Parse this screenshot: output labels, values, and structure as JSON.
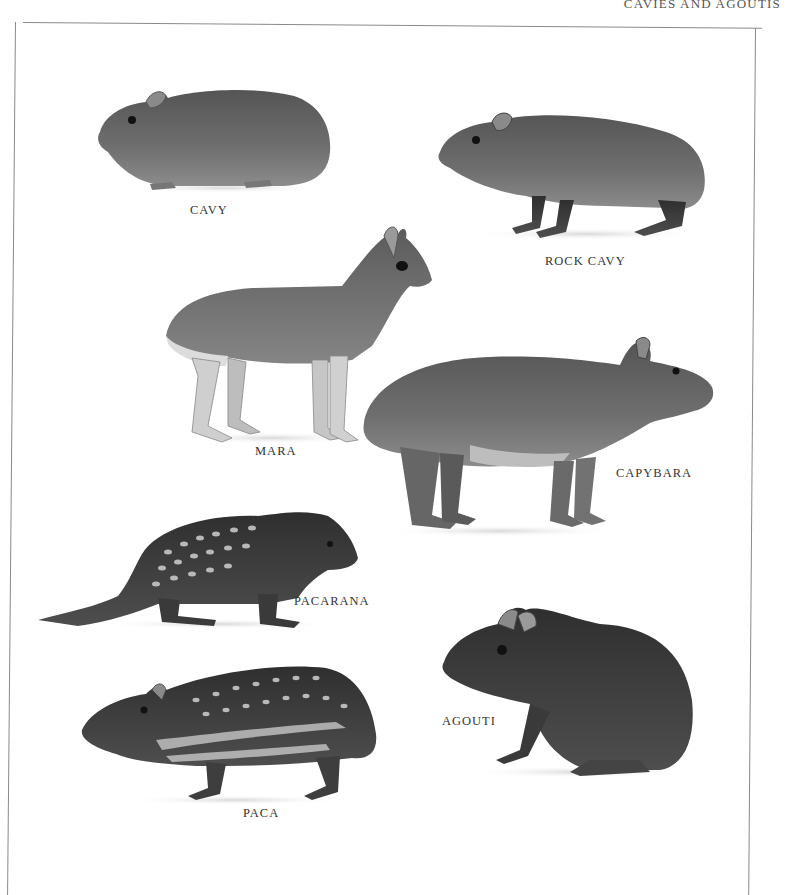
{
  "page": {
    "running_head": "CAVIES AND AGOUTIS"
  },
  "plate": {
    "animals": [
      {
        "id": "cavy",
        "label": "CAVY"
      },
      {
        "id": "rock-cavy",
        "label": "ROCK CAVY"
      },
      {
        "id": "mara",
        "label": "MARA"
      },
      {
        "id": "capybara",
        "label": "CAPYBARA"
      },
      {
        "id": "pacarana",
        "label": "PACARANA"
      },
      {
        "id": "agouti",
        "label": "AGOUTI"
      },
      {
        "id": "paca",
        "label": "PACA"
      }
    ]
  },
  "colors": {
    "fur_dark": "#4a4a4a",
    "fur_mid": "#6e6e6e",
    "fur_light": "#a8a8a8",
    "belly": "#d6d6d6",
    "frame": "#8a8a8a"
  }
}
